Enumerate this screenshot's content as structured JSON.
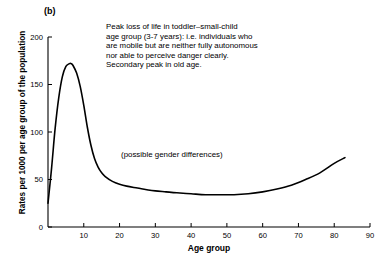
{
  "panel": {
    "label": "(b)"
  },
  "annotation": {
    "text": "Peak loss of life in toddler–small-child\nage group (3-7 years): i.e. individuals who\nare mobile but are neither fully autonomous\nnor able to perceive danger clearly.\nSecondary peak in old age.",
    "lines": [
      "Peak loss of life in toddler–small-child",
      "age group (3-7 years): i.e. individuals who",
      "are mobile but are neither fully autonomous",
      "nor able to perceive danger clearly.",
      "Secondary peak in old age."
    ]
  },
  "inline_note": {
    "text": "(possible gender differences)"
  },
  "colors": {
    "line": "#000000",
    "axis": "#000000",
    "background": "#ffffff"
  },
  "chart_data": {
    "type": "line",
    "title": "",
    "xlabel": "Age group",
    "ylabel": "Rates per 1000 per age group of the population",
    "xlim": [
      0,
      90
    ],
    "ylim": [
      0,
      200
    ],
    "xticks": [
      10,
      20,
      30,
      40,
      50,
      60,
      70,
      80,
      90
    ],
    "yticks": [
      0,
      50,
      100,
      150,
      200
    ],
    "grid": false,
    "legend": false,
    "annotations": [
      {
        "text": "Peak loss of life in toddler–small-child age group (3-7 years): i.e. individuals who are mobile but are neither fully autonomous nor able to perceive danger clearly. Secondary peak in old age.",
        "x": 22,
        "y": 190
      },
      {
        "text": "(possible gender differences)",
        "x": 40,
        "y": 72
      }
    ],
    "series": [
      {
        "name": "Mortality rate by age group",
        "x": [
          0,
          1,
          2,
          3,
          4,
          5,
          6,
          6.5,
          7,
          8,
          9,
          10,
          11,
          12,
          13,
          14,
          15,
          16,
          18,
          20,
          22,
          25,
          28,
          30,
          33,
          36,
          40,
          44,
          48,
          52,
          56,
          60,
          64,
          68,
          72,
          76,
          80,
          83
        ],
        "values": [
          25,
          62,
          104,
          136,
          158,
          169,
          172,
          172,
          170,
          162,
          148,
          128,
          105,
          86,
          72,
          63,
          57,
          53,
          48,
          45,
          43,
          41,
          39,
          38,
          37,
          36,
          35,
          34,
          34,
          34,
          35,
          37,
          40,
          44,
          50,
          57,
          67,
          73
        ]
      }
    ],
    "features": {
      "primary_peak": {
        "age": 6.5,
        "value": 172
      },
      "minimum": {
        "age": 48,
        "value": 34
      },
      "end_point": {
        "age": 83,
        "value": 73
      },
      "start_point": {
        "age": 0,
        "value": 25
      }
    }
  }
}
